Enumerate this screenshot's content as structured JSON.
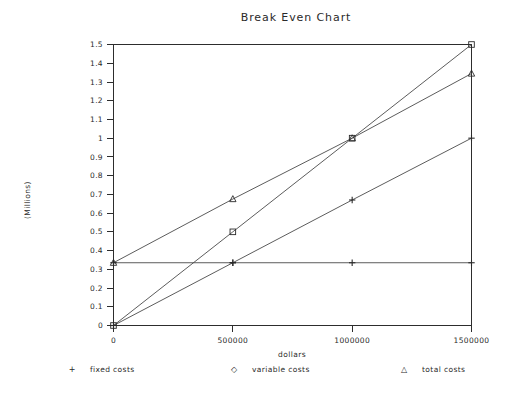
{
  "chart_data": {
    "type": "line",
    "title": "Break Even Chart",
    "xlabel": "dollars",
    "ylabel": "(Millions)",
    "xlim": [
      0,
      1500000
    ],
    "ylim": [
      0,
      1.5
    ],
    "grid": false,
    "legend_position": "bottom",
    "x": [
      0,
      500000,
      1000000,
      1500000
    ],
    "xticklabels": [
      "0",
      "500000",
      "1000000",
      "1500000"
    ],
    "yticklabels": [
      "0",
      "0.1",
      "0.2",
      "0.3",
      "0.4",
      "0.5",
      "0.6",
      "0.7",
      "0.8",
      "0.9",
      "1",
      "1.1",
      "1.2",
      "1.3",
      "1.4",
      "1.5"
    ],
    "yticks": [
      0,
      0.1,
      0.2,
      0.3,
      0.4,
      0.5,
      0.6,
      0.7,
      0.8,
      0.9,
      1.0,
      1.1,
      1.2,
      1.3,
      1.4,
      1.5
    ],
    "series": [
      {
        "name": "fixed costs",
        "marker": "plus",
        "values": [
          0.335,
          0.335,
          0.335,
          0.335
        ]
      },
      {
        "name": "variable costs",
        "marker": "diamond",
        "values": [
          0.0,
          0.5,
          1.0,
          1.5
        ]
      },
      {
        "name": "total costs",
        "marker": "triangle",
        "values": [
          0.335,
          0.675,
          1.0,
          1.345
        ]
      },
      {
        "name": "revenue",
        "marker": "plus",
        "values": [
          0.0,
          0.335,
          0.67,
          1.0
        ]
      }
    ]
  },
  "legend": {
    "items": [
      {
        "mark": "+",
        "label": "fixed costs"
      },
      {
        "mark": "◇",
        "label": "variable costs"
      },
      {
        "mark": "△",
        "label": "total costs"
      }
    ]
  },
  "colors": {
    "axis": "#2d2d2d",
    "series": "#4a4a4a",
    "text": "#2a2a2a",
    "background": "#ffffff"
  }
}
